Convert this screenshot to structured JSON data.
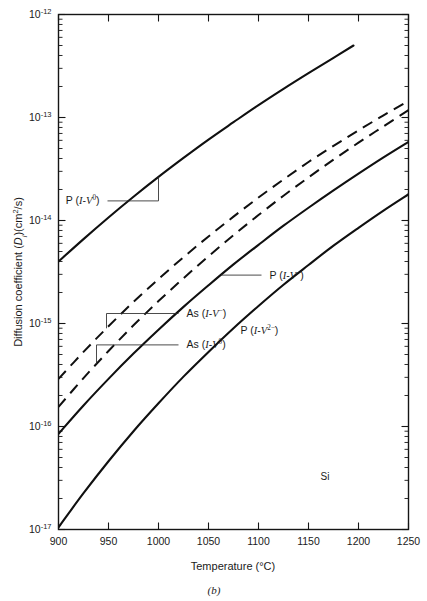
{
  "chart_data": {
    "type": "line",
    "title": "",
    "subtitle": "",
    "figure_caption": "(b)",
    "xlabel": "Temperature (°C)",
    "ylabel": "Diffusion coefficient (Dᵢ)(cm²/s)",
    "ylabel_parts": {
      "lead": "Diffusion coefficient (",
      "sym": "D",
      "sub": "i",
      "tail": ")(cm",
      "exp": "2",
      "tail2": "/s)"
    },
    "annotation": "Si",
    "xscale": "linear",
    "yscale": "log",
    "xlim": [
      900,
      1250
    ],
    "ylim": [
      1e-17,
      1e-12
    ],
    "xticks": [
      900,
      950,
      1000,
      1050,
      1100,
      1150,
      1200,
      1250
    ],
    "xtick_labels": [
      "900",
      "950",
      "1000",
      "1050",
      "1100",
      "1150",
      "1200",
      "1250"
    ],
    "yticks": [
      1e-17,
      1e-16,
      1e-15,
      1e-14,
      1e-13,
      1e-12
    ],
    "ytick_labels": [
      "10–17",
      "10–16",
      "10–15",
      "10–14",
      "10–13",
      "10–12"
    ],
    "ytick_exponents": [
      "-17",
      "-16",
      "-15",
      "-14",
      "-13",
      "-12"
    ],
    "ytick_mantissa": "10",
    "grid": false,
    "legend_position": "inline-labels",
    "minor_ticks": true,
    "series": [
      {
        "name": "P (I-V⁰)",
        "label_parts": {
          "species": "P",
          "open": " (",
          "I": "I",
          "dash": "-",
          "V": "V",
          "sup": "0",
          "close": ")"
        },
        "style": "solid",
        "x": [
          900,
          925,
          950,
          975,
          1000,
          1025,
          1050,
          1075,
          1100,
          1125,
          1150,
          1175,
          1195
        ],
        "y": [
          4e-15,
          6.6e-15,
          1.07e-14,
          1.7e-14,
          2.65e-14,
          4.05e-14,
          6.1e-14,
          9e-14,
          1.32e-13,
          1.9e-13,
          2.7e-13,
          3.8e-13,
          5e-13
        ],
        "label_xy": [
          947,
          1.55e-14
        ]
      },
      {
        "name": "As (I-V⁻)",
        "label_parts": {
          "species": "As",
          "open": " (",
          "I": "I",
          "dash": "-",
          "V": "V",
          "sup": "−",
          "close": ")"
        },
        "style": "dashed",
        "x": [
          900,
          925,
          950,
          975,
          1000,
          1025,
          1050,
          1075,
          1100,
          1125,
          1150,
          1175,
          1200,
          1225,
          1250
        ],
        "y": [
          2.9e-16,
          5.3e-16,
          9.4e-16,
          1.62e-15,
          2.7e-15,
          4.4e-15,
          7e-15,
          1.09e-14,
          1.67e-14,
          2.5e-14,
          3.7e-14,
          5.3e-14,
          7.5e-14,
          1.05e-13,
          1.45e-13
        ],
        "label_xy": [
          1022,
          1.25e-15
        ]
      },
      {
        "name": "As (I-V⁰)",
        "label_parts": {
          "species": "As",
          "open": " (",
          "I": "I",
          "dash": "-",
          "V": "V",
          "sup": "0",
          "close": ")"
        },
        "style": "dashed",
        "x": [
          900,
          925,
          950,
          975,
          1000,
          1025,
          1050,
          1075,
          1100,
          1125,
          1150,
          1175,
          1200,
          1225,
          1250
        ],
        "y": [
          1.55e-16,
          2.95e-16,
          5.4e-16,
          9.6e-16,
          1.65e-15,
          2.75e-15,
          4.5e-15,
          7.2e-15,
          1.13e-14,
          1.74e-14,
          2.62e-14,
          3.9e-14,
          5.7e-14,
          8.2e-14,
          1.18e-13
        ],
        "label_xy": [
          1022,
          6.2e-16
        ]
      },
      {
        "name": "P (I-V⁻)",
        "label_parts": {
          "species": "P",
          "open": " (",
          "I": "I",
          "dash": "-",
          "V": "V",
          "sup": "−",
          "close": ")"
        },
        "style": "solid",
        "x": [
          900,
          925,
          950,
          975,
          1000,
          1025,
          1050,
          1075,
          1100,
          1125,
          1150,
          1175,
          1200,
          1225,
          1250
        ],
        "y": [
          8.5e-17,
          1.6e-16,
          2.9e-16,
          5.1e-16,
          8.7e-16,
          1.45e-15,
          2.35e-15,
          3.75e-15,
          5.8e-15,
          8.9e-15,
          1.33e-14,
          1.96e-14,
          2.85e-14,
          4.1e-14,
          5.8e-14
        ],
        "label_xy": [
          1105,
          2.95e-15
        ]
      },
      {
        "name": "P (I-V²⁻)",
        "label_parts": {
          "species": "P",
          "open": " (",
          "I": "I",
          "dash": "-",
          "V": "V",
          "sup": "2−",
          "close": ")"
        },
        "style": "solid",
        "x": [
          900,
          925,
          950,
          975,
          1000,
          1025,
          1050,
          1075,
          1100,
          1125,
          1150,
          1175,
          1200,
          1225,
          1250
        ],
        "y": [
          1.05e-17,
          2.25e-17,
          4.6e-17,
          9e-17,
          1.68e-16,
          3.05e-16,
          5.3e-16,
          9e-16,
          1.48e-15,
          2.38e-15,
          3.7e-15,
          5.7e-15,
          8.5e-15,
          1.25e-14,
          1.8e-14
        ],
        "label_xy": [
          1082,
          8.6e-16
        ]
      }
    ]
  }
}
